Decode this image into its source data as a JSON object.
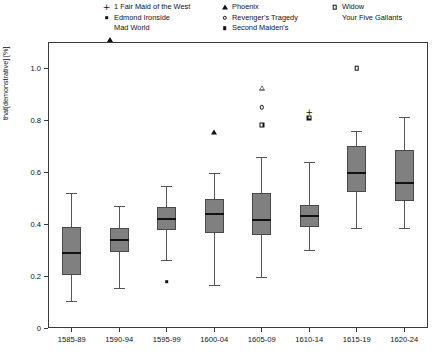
{
  "chart_data": {
    "type": "box",
    "title": "",
    "xlabel": "",
    "ylabel": "that[demonstrative] [%]",
    "categories": [
      "1585-89",
      "1590-94",
      "1595-99",
      "1600-04",
      "1605-09",
      "1610-14",
      "1615-19",
      "1620-24"
    ],
    "ylim": [
      0,
      1.1
    ],
    "yticks": [
      0,
      0.2,
      0.4,
      0.6,
      0.8,
      1.0
    ],
    "ytick_labels": [
      "0",
      "0.2",
      "0.4",
      "0.6",
      "0.8",
      "1.0"
    ],
    "grid": false,
    "legend_position": "top",
    "boxes": [
      {
        "category": "1585-89",
        "whisker_low": 0.105,
        "q1": 0.205,
        "median": 0.287,
        "q3": 0.387,
        "whisker_high": 0.518,
        "outliers": []
      },
      {
        "category": "1590-94",
        "whisker_low": 0.155,
        "q1": 0.293,
        "median": 0.338,
        "q3": 0.383,
        "whisker_high": 0.47,
        "outliers": []
      },
      {
        "category": "1595-99",
        "whisker_low": 0.262,
        "q1": 0.378,
        "median": 0.421,
        "q3": 0.466,
        "whisker_high": 0.545,
        "outliers": [
          {
            "value": 0.178,
            "marker": "square-filled",
            "series": "Second Maiden's"
          }
        ]
      },
      {
        "category": "1600-04",
        "whisker_low": 0.167,
        "q1": 0.366,
        "median": 0.437,
        "q3": 0.498,
        "whisker_high": 0.597,
        "outliers": [
          {
            "value": 0.752,
            "marker": "triangle-filled",
            "series": "Phoenix"
          }
        ]
      },
      {
        "category": "1605-09",
        "whisker_low": 0.196,
        "q1": 0.357,
        "median": 0.415,
        "q3": 0.52,
        "whisker_high": 0.657,
        "outliers": [
          {
            "value": 0.925,
            "marker": "triangle-open",
            "series": "Mad World"
          },
          {
            "value": 0.849,
            "marker": "circle-open",
            "series": "Revenger's Tragedy"
          },
          {
            "value": 0.781,
            "marker": "square-star",
            "series": "Your Five Gallants"
          }
        ]
      },
      {
        "category": "1610-14",
        "whisker_low": 0.3,
        "q1": 0.39,
        "median": 0.432,
        "q3": 0.472,
        "whisker_high": 0.64,
        "outliers": [
          {
            "value": 0.829,
            "marker": "plus",
            "series": "1 Fair Maid of the West"
          },
          {
            "value": 0.808,
            "marker": "square-star",
            "series": "Your Five Gallants"
          }
        ]
      },
      {
        "category": "1615-19",
        "whisker_low": 0.383,
        "q1": 0.523,
        "median": 0.596,
        "q3": 0.7,
        "whisker_high": 0.757,
        "outliers": [
          {
            "value": 1.0,
            "marker": "square-open",
            "series": "Widow"
          }
        ]
      },
      {
        "category": "1620-24",
        "whisker_low": 0.383,
        "q1": 0.49,
        "median": 0.556,
        "q3": 0.683,
        "whisker_high": 0.81,
        "outliers": []
      }
    ]
  },
  "legend": {
    "columns": [
      {
        "entries": [
          {
            "marker": "plus",
            "label": "1 Fair Maid of the West"
          },
          {
            "marker": "square-filled",
            "label": "Edmond Ironside"
          },
          {
            "marker": "triangle-open",
            "label": "Mad World"
          }
        ]
      },
      {
        "entries": [
          {
            "marker": "triangle-filled",
            "label": "Phoenix"
          },
          {
            "marker": "circle-open",
            "label": "Revenger's Tragedy"
          },
          {
            "marker": "square-filled",
            "label": "Second Maiden's"
          }
        ]
      },
      {
        "entries": [
          {
            "marker": "square-open",
            "label": "Widow"
          },
          {
            "marker": "square-star",
            "label": "Your Five Gallants"
          }
        ]
      }
    ]
  },
  "colors": {
    "box_fill": "#808080",
    "box_edge": "#4a4a4a",
    "median": "#111111",
    "whisker": "#555555",
    "axis": "#3a3a3a",
    "background": "#ffffff"
  }
}
